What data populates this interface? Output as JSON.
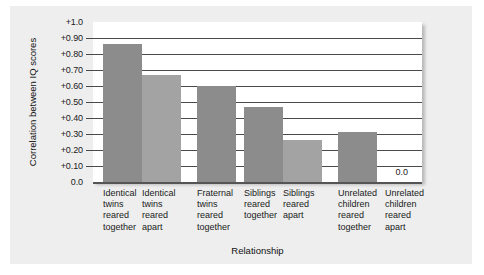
{
  "chart_data": {
    "type": "bar",
    "title": "",
    "xlabel": "Relationship",
    "ylabel": "Correlation between IQ scores",
    "ylim": [
      0.0,
      1.0
    ],
    "grid": true,
    "legend": "none",
    "ytick_labels": [
      "+1.0",
      "+0.90",
      "+0.80",
      "+0.70",
      "+0.60",
      "+0.50",
      "+0.40",
      "+0.30",
      "+0.20",
      "+0.10",
      "0.0"
    ],
    "ytick_values": [
      1.0,
      0.9,
      0.8,
      0.7,
      0.6,
      0.5,
      0.4,
      0.3,
      0.2,
      0.1,
      0.0
    ],
    "categories": [
      "Identical\ntwins\nreared\ntogether",
      "Identical\ntwins\nreared\napart",
      "Fraternal\ntwins\nreared\ntogether",
      "Siblings\nreared\ntogether",
      "Siblings\nreared\napart",
      "Unrelated\nchildren\nreared\ntogether",
      "Unrelated\nchildren\nreared\napart"
    ],
    "values": [
      0.86,
      0.67,
      0.6,
      0.47,
      0.26,
      0.31,
      0.0
    ],
    "value_labels": [
      "",
      "",
      "",
      "",
      "",
      "",
      "0.0"
    ],
    "bar_colors": [
      "#8c8c8c",
      "#a3a3a3",
      "#8c8c8c",
      "#8c8c8c",
      "#a3a3a3",
      "#8c8c8c",
      "#8c8c8c"
    ],
    "colors": {
      "bar_dark": "#8c8c8c",
      "bar_light": "#a3a3a3",
      "plot_background": "#ffffff",
      "card_background": "#eeeeee",
      "gridline": "#4a4a4a",
      "axis": "#555555",
      "text": "#1a1a1a"
    }
  }
}
